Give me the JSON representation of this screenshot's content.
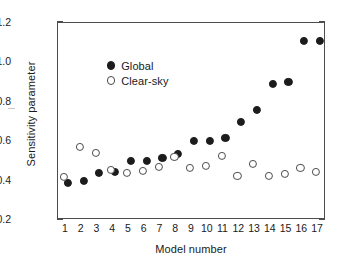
{
  "chart_data": {
    "type": "scatter",
    "title": "",
    "xlabel": "Model number",
    "ylabel": "Sensitivity parameter",
    "xlim": [
      0.5,
      17.5
    ],
    "ylim": [
      0.2,
      1.2
    ],
    "yticks": [
      "0.2",
      "0.4",
      "0.6",
      "0.8",
      "1.0",
      "1.2"
    ],
    "ytick_values": [
      0.2,
      0.4,
      0.6,
      0.8,
      1.0,
      1.2
    ],
    "y_minor_step": 0.1,
    "grid": false,
    "legend_position": "upper-left-inside",
    "categories": [
      "1",
      "2",
      "3",
      "4",
      "5",
      "6",
      "7",
      "8",
      "9",
      "10",
      "11",
      "12",
      "13",
      "14",
      "15",
      "16",
      "17"
    ],
    "x": [
      1,
      2,
      3,
      4,
      5,
      6,
      7,
      8,
      9,
      10,
      11,
      12,
      13,
      14,
      15,
      16,
      17
    ],
    "series": [
      {
        "name": "Global",
        "marker": "filled-circle",
        "color": "#1c1c1c",
        "values": [
          0.39,
          0.4,
          0.44,
          0.445,
          0.5,
          0.5,
          0.515,
          0.535,
          0.6,
          0.6,
          0.615,
          0.7,
          0.76,
          0.89,
          0.9,
          1.11,
          1.11
        ]
      },
      {
        "name": "Clear-sky",
        "marker": "open-circle",
        "color": "#4a4a4a",
        "values": [
          0.42,
          0.57,
          0.54,
          0.455,
          0.44,
          0.45,
          0.47,
          0.52,
          0.465,
          0.475,
          0.525,
          0.425,
          0.485,
          0.425,
          0.435,
          0.465,
          0.445
        ]
      }
    ]
  },
  "legend": {
    "items": [
      {
        "label": "Global",
        "marker": "filled-circle"
      },
      {
        "label": "Clear-sky",
        "marker": "open-circle"
      }
    ]
  }
}
